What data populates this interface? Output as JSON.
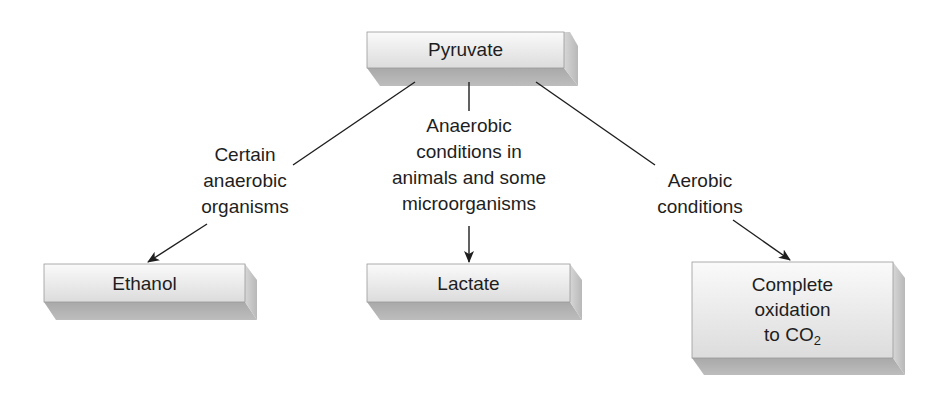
{
  "diagram": {
    "nodes": {
      "source": {
        "id": "pyruvate",
        "label": "Pyruvate"
      },
      "ethanol": {
        "id": "ethanol",
        "label": "Ethanol"
      },
      "lactate": {
        "id": "lactate",
        "label": "Lactate"
      },
      "co2": {
        "id": "complete-oxidation",
        "line1": "Complete",
        "line2": "oxidation",
        "line3_prefix": "to CO",
        "line3_sub": "2"
      }
    },
    "edges": [
      {
        "from": "pyruvate",
        "to": "ethanol",
        "label_lines": [
          "Certain",
          "anaerobic",
          "organisms"
        ]
      },
      {
        "from": "pyruvate",
        "to": "lactate",
        "label_lines": [
          "Anaerobic",
          "conditions in",
          "animals and some",
          "microorganisms"
        ]
      },
      {
        "from": "pyruvate",
        "to": "complete-oxidation",
        "label_lines": [
          "Aerobic",
          "conditions"
        ]
      }
    ],
    "colors": {
      "box_face_light": "#f4f4f4",
      "box_face_dark": "#d9d9d9",
      "box_bottom": "#b3b3b3",
      "box_side": "#c8c8c8",
      "line": "#1e1e1e"
    }
  }
}
